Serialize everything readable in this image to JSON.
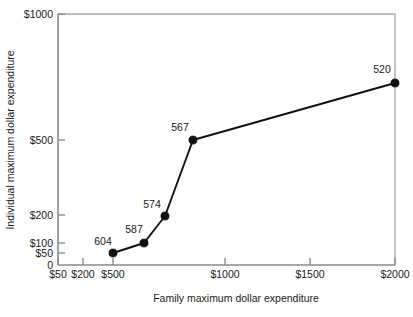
{
  "chart_data": {
    "type": "line",
    "title": "",
    "xlabel": "Family maximum dollar expenditure",
    "ylabel": "Individual maximum dollar expenditure",
    "xscale": "log-like",
    "yscale": "log-like",
    "grid": false,
    "legend": "none",
    "xticks": [
      {
        "label": "$50",
        "value": 50,
        "px": 58
      },
      {
        "label": "$200",
        "value": 200,
        "px": 83
      },
      {
        "label": "$500",
        "value": 500,
        "px": 113
      },
      {
        "label": "$1000",
        "value": 1000,
        "px": 225
      },
      {
        "label": "$1500",
        "value": 1500,
        "px": 310
      },
      {
        "label": "$2000",
        "value": 2000,
        "px": 395
      }
    ],
    "yticks": [
      {
        "label": "$1000",
        "value": 1000,
        "px": 14
      },
      {
        "label": "$500",
        "value": 500,
        "px": 140
      },
      {
        "label": "$200",
        "value": 200,
        "px": 215
      },
      {
        "label": "$100",
        "value": 100,
        "px": 243
      },
      {
        "label": "$50",
        "value": 50,
        "px": 253
      },
      {
        "label": "0",
        "value": 0,
        "px": 265
      }
    ],
    "xlim": [
      50,
      2000
    ],
    "ylim": [
      0,
      1000
    ],
    "points": [
      {
        "label": "604",
        "x": 340,
        "y": 50,
        "px": 113,
        "py": 253,
        "label_px": 103,
        "label_py": 245,
        "anchor": "middle"
      },
      {
        "label": "587",
        "x": 530,
        "y": 100,
        "px": 144,
        "py": 243,
        "label_px": 134,
        "label_py": 233,
        "anchor": "middle"
      },
      {
        "label": "574",
        "x": 660,
        "y": 200,
        "px": 165,
        "py": 216,
        "label_px": 152,
        "label_py": 208,
        "anchor": "middle"
      },
      {
        "label": "567",
        "x": 840,
        "y": 500,
        "px": 193,
        "py": 140,
        "label_px": 180,
        "label_py": 131,
        "anchor": "middle"
      },
      {
        "label": "520",
        "x": 2000,
        "y": 750,
        "px": 395,
        "py": 83,
        "label_px": 382,
        "label_py": 73,
        "anchor": "middle"
      }
    ],
    "series": [
      {
        "name": "individual maximum vs family maximum",
        "categories": [
          "604",
          "587",
          "574",
          "567",
          "520"
        ],
        "x": [
          340,
          530,
          660,
          840,
          2000
        ],
        "values": [
          50,
          100,
          200,
          500,
          750
        ]
      }
    ],
    "plot_frame": {
      "left": 58,
      "right": 395,
      "top": 14,
      "bottom": 265
    }
  }
}
